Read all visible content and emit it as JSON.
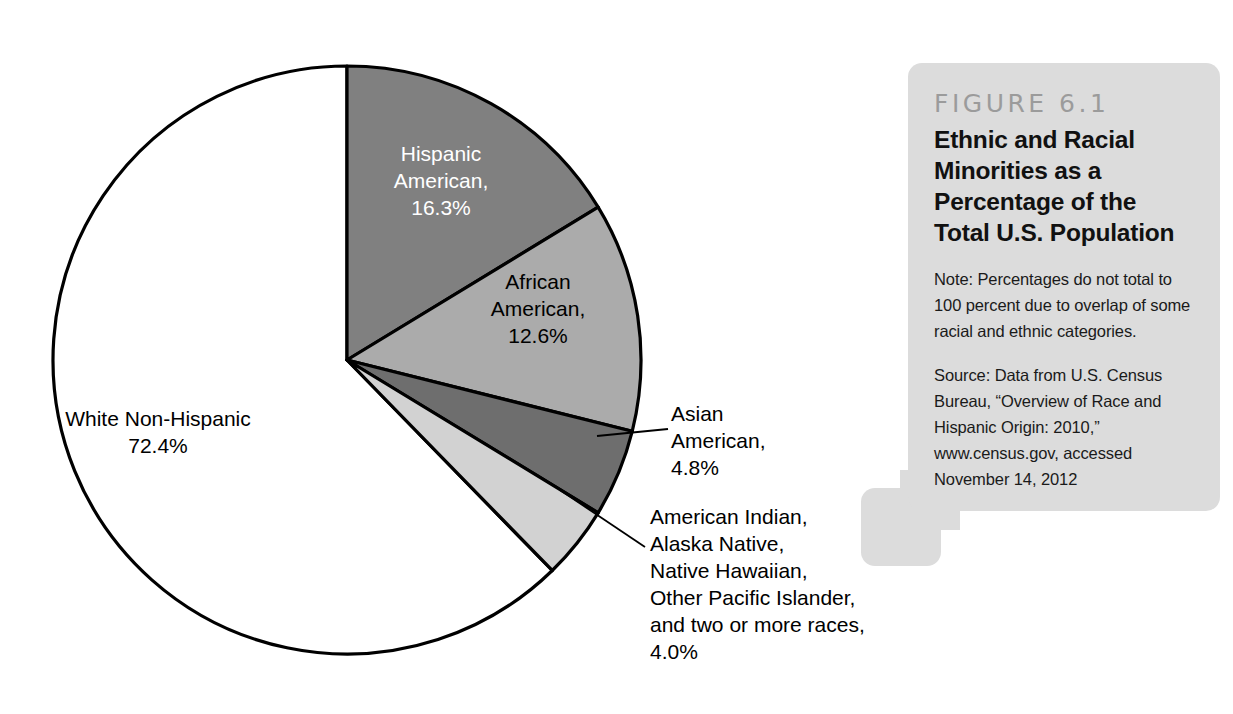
{
  "chart_data": {
    "type": "pie",
    "title": "Ethnic and Racial Minorities as a Percentage of the Total U.S. Population",
    "figure_number": "FIGURE 6.1",
    "categories": [
      "White Non-Hispanic",
      "Hispanic American",
      "African American",
      "Asian American",
      "American Indian, Alaska Native, Native Hawaiian, Other Pacific Islander, and two or more races"
    ],
    "values": [
      72.4,
      16.3,
      12.6,
      4.8,
      4.0
    ],
    "value_labels": [
      "72.4%",
      "16.3%",
      "12.6%",
      "4.8%",
      "4.0%"
    ],
    "colors": [
      "#ffffff",
      "#808080",
      "#ababab",
      "#6e6e6e",
      "#d2d2d2"
    ],
    "start_angle_deg": 0,
    "direction": "clockwise",
    "legend": "none",
    "grid": false,
    "note": "Percentages do not total to 100 percent due to overlap of some racial and ethnic categories.",
    "total_note": "Values sum to 110.1% due to category overlap"
  },
  "pie": {
    "center_x": 347,
    "center_y": 360,
    "radius": 294,
    "slices": [
      {
        "key": "hispanic",
        "label_text": "Hispanic\nAmerican,\n16.3%",
        "name": "Hispanic American",
        "percent": "16.3%",
        "fill": "#808080",
        "text_color": "#ffffff",
        "start_deg": 0,
        "end_deg": 58.68
      },
      {
        "key": "african",
        "label_text": "African\nAmerican,\n12.6%",
        "name": "African American",
        "percent": "12.6%",
        "fill": "#ababab",
        "text_color": "#000000",
        "start_deg": 58.68,
        "end_deg": 104.04
      },
      {
        "key": "asian",
        "label_text": "Asian\nAmerican,\n4.8%",
        "name": "Asian American",
        "percent": "4.8%",
        "fill": "#6e6e6e",
        "text_color": "#000000",
        "start_deg": 104.04,
        "end_deg": 121.32
      },
      {
        "key": "amerindian",
        "label_text": "American Indian,\nAlaska Native,\nNative Hawaiian,\nOther Pacific Islander,\nand two or more races,\n4.0%",
        "name": "American Indian, Alaska Native, Native Hawaiian, Other Pacific Islander, and two or more races",
        "percent": "4.0%",
        "fill": "#d2d2d2",
        "text_color": "#000000",
        "start_deg": 121.32,
        "end_deg": 135.72
      },
      {
        "key": "white",
        "label_text": "White Non-Hispanic\n72.4%",
        "name": "White Non-Hispanic",
        "percent": "72.4%",
        "fill": "#ffffff",
        "text_color": "#000000",
        "start_deg": 135.72,
        "end_deg": 360
      }
    ]
  },
  "caption": {
    "figure_number": "FIGURE 6.1",
    "title": "Ethnic and Racial Minorities as a Percentage of the Total U.S. Population",
    "note": "Note: Percentages do not total to 100 percent due to overlap of some racial and ethnic categories.",
    "source": "Source: Data from U.S. Census Bureau, “Overview of Race and Hispanic Origin: 2010,” www.census.gov, accessed November 14, 2012"
  },
  "colors": {
    "caption_background": "#dcdcdc",
    "figure_number_color": "#9b9b9b",
    "outline": "#000000",
    "page_background": "#ffffff"
  }
}
